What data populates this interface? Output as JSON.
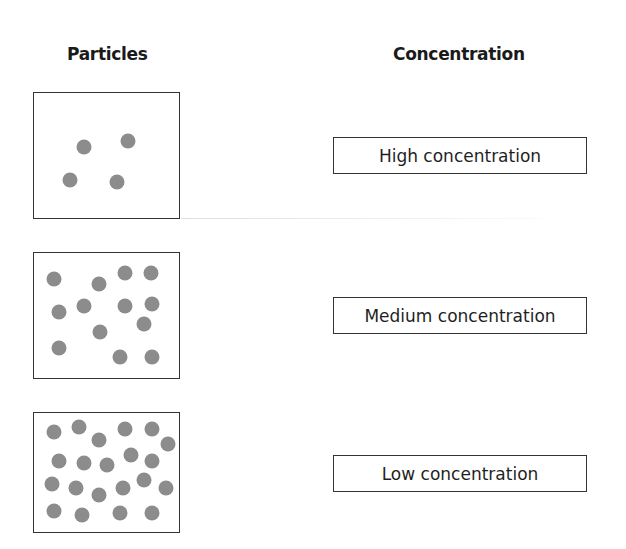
{
  "headings": {
    "particles": "Particles",
    "concentration": "Concentration"
  },
  "colors": {
    "particle": "#8c8c8c",
    "border": "#333333",
    "text": "#1a1a1a"
  },
  "rows": [
    {
      "particle_count": 4,
      "label": "High concentration",
      "dots": [
        [
          50,
          54
        ],
        [
          94,
          48
        ],
        [
          36,
          87
        ],
        [
          83,
          89
        ]
      ]
    },
    {
      "particle_count": 13,
      "label": "Medium concentration",
      "dots": [
        [
          20,
          26
        ],
        [
          65,
          31
        ],
        [
          91,
          20
        ],
        [
          117,
          20
        ],
        [
          25,
          59
        ],
        [
          50,
          53
        ],
        [
          91,
          53
        ],
        [
          118,
          51
        ],
        [
          110,
          71
        ],
        [
          66,
          79
        ],
        [
          25,
          95
        ],
        [
          86,
          104
        ],
        [
          118,
          104
        ]
      ]
    },
    {
      "particle_count": 21,
      "label": "Low concentration",
      "dots": [
        [
          20,
          19
        ],
        [
          45,
          14
        ],
        [
          65,
          27
        ],
        [
          91,
          16
        ],
        [
          118,
          16
        ],
        [
          134,
          31
        ],
        [
          25,
          48
        ],
        [
          50,
          50
        ],
        [
          73,
          52
        ],
        [
          97,
          42
        ],
        [
          118,
          48
        ],
        [
          18,
          71
        ],
        [
          42,
          75
        ],
        [
          65,
          82
        ],
        [
          89,
          75
        ],
        [
          110,
          67
        ],
        [
          132,
          75
        ],
        [
          20,
          98
        ],
        [
          48,
          102
        ],
        [
          86,
          100
        ],
        [
          118,
          100
        ]
      ]
    }
  ]
}
